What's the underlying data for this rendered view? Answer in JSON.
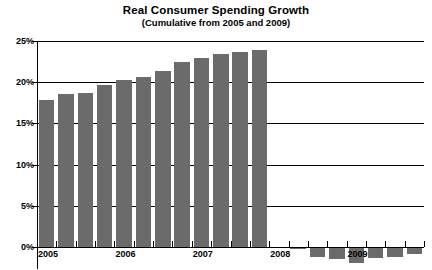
{
  "chart_data": {
    "type": "bar",
    "title": "Real Consumer Spending Growth",
    "subtitle": "(Cumulative from 2005 and 2009)",
    "xlabel": "",
    "ylabel": "",
    "ylim": [
      -2,
      25
    ],
    "ytick_labels": [
      "0%",
      "5%",
      "10%",
      "15%",
      "20%",
      "25%"
    ],
    "ytick_values": [
      0,
      5,
      10,
      15,
      20,
      25
    ],
    "grid": true,
    "legend": "none",
    "bar_color": "#6b6b6b",
    "axis_color": "#000000",
    "background": "#ffffff",
    "x_year_labels": [
      "2005",
      "2006",
      "2007",
      "2008",
      "2009"
    ],
    "categories": [
      "2005 Q1",
      "2005 Q2",
      "2005 Q3",
      "2005 Q4",
      "2006 Q1",
      "2006 Q2",
      "2006 Q3",
      "2006 Q4",
      "2007 Q1",
      "2007 Q2",
      "2007 Q3",
      "2007 Q4",
      "2008 Q1",
      "2008 Q2",
      "2008 Q3",
      "2008 Q4",
      "2009 Q1",
      "2009 Q2",
      "2009 Q3",
      "2009 Q4"
    ],
    "values": [
      17.9,
      18.6,
      18.7,
      19.7,
      20.3,
      20.6,
      21.4,
      22.4,
      22.9,
      23.4,
      23.7,
      23.9,
      null,
      -0.3,
      -1.2,
      -1.5,
      -2.0,
      -1.3,
      -1.2,
      -0.8
    ]
  }
}
